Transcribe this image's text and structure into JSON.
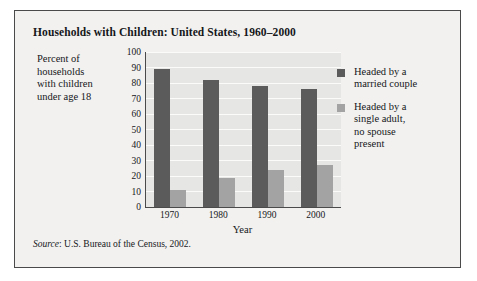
{
  "figure": {
    "title": "Households with Children: United States, 1960–2000",
    "source_word": "Source",
    "source_text": ": U.S. Bureau of the Census, 2002."
  },
  "colors": {
    "series_married": "#5b5b5b",
    "series_single": "#a3a3a3",
    "plot_background": "#e6e6e4",
    "gridline": "#fbfbfa",
    "card_background": "#f2f1ef",
    "border": "#4a4a4a",
    "text": "#15171a"
  },
  "chart_data": {
    "type": "bar",
    "title": "Households with Children: United States, 1960–2000",
    "xlabel": "Year",
    "ylabel": "Percent of households with children under age 18",
    "categories": [
      "1970",
      "1980",
      "1990",
      "2000"
    ],
    "series": [
      {
        "name": "Headed by a married couple",
        "color": "#5b5b5b",
        "values": [
          89,
          82,
          78,
          76
        ]
      },
      {
        "name": "Headed by a single adult, no spouse present",
        "color": "#a3a3a3",
        "values": [
          11,
          19,
          24,
          27
        ]
      }
    ],
    "ylim": [
      0,
      100
    ],
    "yticks": [
      0,
      10,
      20,
      30,
      40,
      50,
      60,
      70,
      80,
      90,
      100
    ],
    "ytick_labels": [
      "0",
      "10",
      "20",
      "30",
      "40",
      "50",
      "60",
      "70",
      "80",
      "90",
      "100"
    ],
    "grid": true,
    "legend_position": "right"
  },
  "axis_titles": {
    "y_lines": [
      "Percent of",
      "households",
      "with children",
      "under age 18"
    ],
    "x": "Year"
  },
  "legend": {
    "items": [
      {
        "lines": [
          "Headed by a",
          "married couple"
        ]
      },
      {
        "lines": [
          "Headed by a",
          "single adult,",
          "no spouse",
          "present"
        ]
      }
    ]
  }
}
